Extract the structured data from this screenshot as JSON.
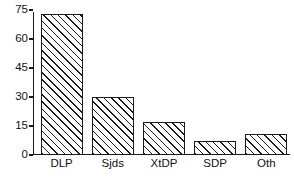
{
  "chart_data": {
    "type": "bar",
    "title": "",
    "subtitle": "",
    "xlabel": "",
    "ylabel": "",
    "categories": [
      "DLP",
      "Sjds",
      "XtDP",
      "SDP",
      "Oth"
    ],
    "values": [
      73,
      30,
      17,
      7.5,
      11
    ],
    "ylim": [
      0,
      75
    ],
    "yticks": [
      0,
      15,
      30,
      45,
      60,
      75
    ],
    "ytick_labels": [
      "0",
      "15",
      "30",
      "45",
      "60",
      "75"
    ],
    "grid": false,
    "legend": null,
    "legend_position": "none",
    "annotations": [],
    "bar_fill": "diagonal-hatch",
    "colors": {
      "axis": "#1a1a1a",
      "bar_edge": "#1a1a1a",
      "bar_face": "#ffffff",
      "hatch": "#1a1a1a",
      "background": "#ffffff",
      "text": "#111111"
    }
  }
}
